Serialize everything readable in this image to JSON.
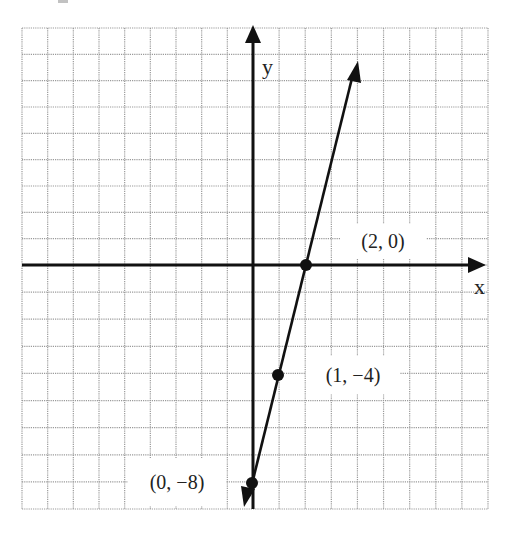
{
  "chart_data": {
    "type": "line",
    "title": "",
    "xlabel": "x",
    "ylabel": "y",
    "xlim": [
      -9,
      9
    ],
    "ylim": [
      -9,
      9
    ],
    "grid": true,
    "grid_step": 1,
    "legend": null,
    "series": [
      {
        "name": "y = 4x - 8",
        "equation": "y = 4x - 8",
        "slope": 4,
        "intercept": -8,
        "x": [
          -0.3,
          3.95
        ],
        "y": [
          -9.2,
          7.8
        ],
        "arrows": "both"
      }
    ],
    "points": [
      {
        "x": 2,
        "y": 0,
        "label": "(2, 0)"
      },
      {
        "x": 1,
        "y": -4,
        "label": "(1, −4)"
      },
      {
        "x": 0,
        "y": -8,
        "label": "(0, −8)"
      }
    ],
    "annotations": [
      "(2, 0)",
      "(1, −4)",
      "(0, −8)"
    ]
  },
  "axes": {
    "x_label": "x",
    "y_label": "y"
  },
  "labels": {
    "p1": "(2, 0)",
    "p2": "(1, −4)",
    "p3": "(0, −8)"
  },
  "colors": {
    "axis": "#111111",
    "grid": "#9a9a9a",
    "line": "#111111",
    "background": "#ffffff"
  }
}
